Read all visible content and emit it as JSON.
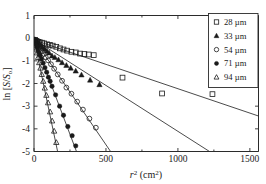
{
  "chart_data": {
    "type": "scatter",
    "title": "",
    "xlabel": "r2 (cm2)",
    "ylabel": "ln [S/So]",
    "xlim": [
      0,
      1560
    ],
    "ylim": [
      -5,
      1
    ],
    "xticks": [
      0,
      500,
      1000,
      1500
    ],
    "yticks": [
      1,
      0,
      -1,
      -2,
      -3,
      -4,
      -5
    ],
    "xtick_labels": [
      "0",
      "500",
      "1000",
      "1500"
    ],
    "ytick_labels": [
      "1",
      "0",
      "-1",
      "-2",
      "-3",
      "-4",
      "-5"
    ],
    "grid": false,
    "legend_position": "top-right",
    "series": [
      {
        "name": "28 µm",
        "marker": "open-square",
        "slope": -0.00215,
        "intercept": -0.08,
        "fit_x": [
          5,
          1560
        ],
        "points": [
          {
            "x": 8,
            "y": -0.08
          },
          {
            "x": 15,
            "y": -0.12
          },
          {
            "x": 22,
            "y": -0.14
          },
          {
            "x": 30,
            "y": -0.16
          },
          {
            "x": 40,
            "y": -0.18
          },
          {
            "x": 55,
            "y": -0.2
          },
          {
            "x": 70,
            "y": -0.23
          },
          {
            "x": 90,
            "y": -0.27
          },
          {
            "x": 110,
            "y": -0.3
          },
          {
            "x": 130,
            "y": -0.33
          },
          {
            "x": 155,
            "y": -0.38
          },
          {
            "x": 180,
            "y": -0.45
          },
          {
            "x": 205,
            "y": -0.5
          },
          {
            "x": 230,
            "y": -0.55
          },
          {
            "x": 260,
            "y": -0.6
          },
          {
            "x": 290,
            "y": -0.63
          },
          {
            "x": 320,
            "y": -0.68
          },
          {
            "x": 350,
            "y": -0.7
          },
          {
            "x": 380,
            "y": -0.72
          },
          {
            "x": 415,
            "y": -0.75
          },
          {
            "x": 615,
            "y": -1.74
          },
          {
            "x": 890,
            "y": -2.44
          },
          {
            "x": 1240,
            "y": -2.47
          }
        ]
      },
      {
        "name": "33 µm",
        "marker": "filled-triangle",
        "slope": -0.00405,
        "intercept": -0.06,
        "fit_x": [
          5,
          1235
        ],
        "points": [
          {
            "x": 6,
            "y": -0.06
          },
          {
            "x": 12,
            "y": -0.1
          },
          {
            "x": 20,
            "y": -0.15
          },
          {
            "x": 28,
            "y": -0.2
          },
          {
            "x": 38,
            "y": -0.27
          },
          {
            "x": 48,
            "y": -0.33
          },
          {
            "x": 60,
            "y": -0.4
          },
          {
            "x": 75,
            "y": -0.48
          },
          {
            "x": 90,
            "y": -0.57
          },
          {
            "x": 105,
            "y": -0.65
          },
          {
            "x": 125,
            "y": -0.78
          },
          {
            "x": 145,
            "y": -0.85
          },
          {
            "x": 170,
            "y": -0.95
          },
          {
            "x": 195,
            "y": -1.08
          },
          {
            "x": 225,
            "y": -1.2
          },
          {
            "x": 255,
            "y": -1.32
          },
          {
            "x": 290,
            "y": -1.45
          },
          {
            "x": 330,
            "y": -1.62
          },
          {
            "x": 390,
            "y": -1.85
          },
          {
            "x": 455,
            "y": -2.05
          }
        ]
      },
      {
        "name": "54 µm",
        "marker": "open-circle",
        "slope": -0.0093,
        "intercept": -0.05,
        "fit_x": [
          4,
          540
        ],
        "points": [
          {
            "x": 5,
            "y": -0.07
          },
          {
            "x": 10,
            "y": -0.13
          },
          {
            "x": 16,
            "y": -0.2
          },
          {
            "x": 24,
            "y": -0.28
          },
          {
            "x": 33,
            "y": -0.38
          },
          {
            "x": 43,
            "y": -0.47
          },
          {
            "x": 55,
            "y": -0.58
          },
          {
            "x": 68,
            "y": -0.7
          },
          {
            "x": 82,
            "y": -0.85
          },
          {
            "x": 98,
            "y": -0.98
          },
          {
            "x": 118,
            "y": -1.15
          },
          {
            "x": 140,
            "y": -1.35
          },
          {
            "x": 165,
            "y": -1.6
          },
          {
            "x": 195,
            "y": -1.88
          },
          {
            "x": 225,
            "y": -2.18
          },
          {
            "x": 260,
            "y": -2.45
          },
          {
            "x": 300,
            "y": -2.8
          },
          {
            "x": 340,
            "y": -3.15
          },
          {
            "x": 385,
            "y": -3.55
          },
          {
            "x": 430,
            "y": -3.95
          }
        ]
      },
      {
        "name": "71 µm",
        "marker": "filled-circle",
        "slope": -0.0168,
        "intercept": -0.04,
        "fit_x": [
          3,
          298
        ],
        "points": [
          {
            "x": 4,
            "y": -0.08
          },
          {
            "x": 8,
            "y": -0.16
          },
          {
            "x": 13,
            "y": -0.25
          },
          {
            "x": 19,
            "y": -0.36
          },
          {
            "x": 26,
            "y": -0.48
          },
          {
            "x": 34,
            "y": -0.62
          },
          {
            "x": 43,
            "y": -0.76
          },
          {
            "x": 53,
            "y": -0.92
          },
          {
            "x": 64,
            "y": -1.1
          },
          {
            "x": 76,
            "y": -1.3
          },
          {
            "x": 88,
            "y": -1.5
          },
          {
            "x": 100,
            "y": -1.72
          },
          {
            "x": 112,
            "y": -1.9
          },
          {
            "x": 125,
            "y": -2.12
          },
          {
            "x": 150,
            "y": -2.5
          },
          {
            "x": 178,
            "y": -3.0
          },
          {
            "x": 205,
            "y": -3.4
          },
          {
            "x": 235,
            "y": -3.9
          },
          {
            "x": 265,
            "y": -4.3
          },
          {
            "x": 290,
            "y": -4.75
          }
        ]
      },
      {
        "name": "94 µm",
        "marker": "open-triangle",
        "slope": -0.0303,
        "intercept": -0.03,
        "fit_x": [
          2,
          164
        ],
        "points": [
          {
            "x": 3,
            "y": -0.1
          },
          {
            "x": 6,
            "y": -0.2
          },
          {
            "x": 10,
            "y": -0.33
          },
          {
            "x": 15,
            "y": -0.48
          },
          {
            "x": 21,
            "y": -0.65
          },
          {
            "x": 28,
            "y": -0.85
          },
          {
            "x": 36,
            "y": -1.08
          },
          {
            "x": 45,
            "y": -1.32
          },
          {
            "x": 54,
            "y": -1.6
          },
          {
            "x": 64,
            "y": -1.9
          },
          {
            "x": 75,
            "y": -2.2
          },
          {
            "x": 86,
            "y": -2.52
          },
          {
            "x": 98,
            "y": -2.85
          },
          {
            "x": 112,
            "y": -3.25
          },
          {
            "x": 126,
            "y": -3.65
          },
          {
            "x": 140,
            "y": -4.1
          },
          {
            "x": 155,
            "y": -4.6
          }
        ]
      }
    ]
  },
  "legend": {
    "items": [
      {
        "label": "28 µm",
        "marker": "open-square"
      },
      {
        "label": "33 µm",
        "marker": "filled-triangle"
      },
      {
        "label": "54 µm",
        "marker": "open-circle"
      },
      {
        "label": "71 µm",
        "marker": "filled-circle"
      },
      {
        "label": "94 µm",
        "marker": "open-triangle"
      }
    ]
  },
  "axes": {
    "y_label_parts": {
      "prefix": "ln [",
      "s1": "S",
      "slash": "/",
      "s2": "S",
      "sub": "o",
      "suffix": "]"
    },
    "x_label_parts": {
      "r": "r",
      "sup1": "2",
      "open": " (cm",
      "sup2": "2",
      "close": ")"
    }
  }
}
